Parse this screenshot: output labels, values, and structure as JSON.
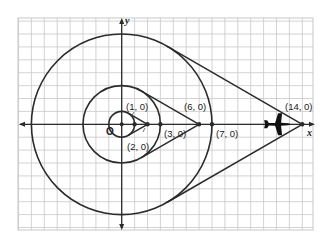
{
  "figure": {
    "type": "coordinate-plane diagram",
    "axes": {
      "x_label": "x",
      "y_label": "y",
      "origin_label": "O"
    },
    "colors": {
      "grid": "#c8c8c8",
      "ink": "#2b2b2b",
      "background": "#ffffff"
    },
    "scale_px_per_unit": 12.9,
    "origin_px": [
      121.7,
      124.3
    ],
    "grid_range": {
      "x": [
        -8,
        15
      ],
      "y": [
        -8,
        8
      ]
    },
    "circles": [
      {
        "name": "small-circle",
        "center": [
          0,
          0
        ],
        "radius": 1
      },
      {
        "name": "middle-circle",
        "center": [
          0,
          0
        ],
        "radius": 3
      },
      {
        "name": "large-circle",
        "center": [
          0,
          0
        ],
        "radius": 7
      }
    ],
    "tangent_points_from": [
      {
        "external_point": [
          2,
          0
        ],
        "circle_radius": 1
      },
      {
        "external_point": [
          6,
          0
        ],
        "circle_radius": 3
      },
      {
        "external_point": [
          14,
          0
        ],
        "circle_radius": 7
      }
    ],
    "points": [
      {
        "label": "(1, 0)",
        "coords": [
          1,
          0
        ]
      },
      {
        "label": "(2, 0)",
        "coords": [
          2,
          0
        ]
      },
      {
        "label": "(3, 0)",
        "coords": [
          3,
          0
        ]
      },
      {
        "label": "(6, 0)",
        "coords": [
          6,
          0
        ]
      },
      {
        "label": "(7, 0)",
        "coords": [
          7,
          0
        ]
      },
      {
        "label": "(14, 0)",
        "coords": [
          14,
          0
        ]
      }
    ],
    "icons": [
      {
        "name": "airplane-icon",
        "coords": [
          12.2,
          0
        ]
      }
    ]
  },
  "labels": {
    "p1": "(1, 0)",
    "p2": "(2, 0)",
    "p3": "(3, 0)",
    "p6": "(6, 0)",
    "p7": "(7, 0)",
    "p14": "(14, 0)",
    "x": "x",
    "y": "y",
    "origin": "O"
  }
}
